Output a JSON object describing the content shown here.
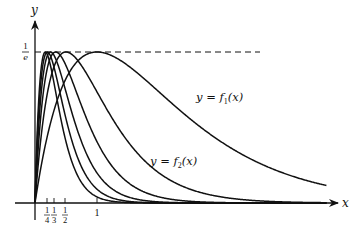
{
  "chart_data": {
    "type": "line",
    "title": "",
    "xlabel": "x",
    "ylabel": "y",
    "formula": "f_n(x) = n*x*exp(-n*x)",
    "x_ticks": [
      {
        "label_num": "1",
        "label_den": "4",
        "value": 0.25
      },
      {
        "label_num": "1",
        "label_den": "3",
        "value": 0.3333
      },
      {
        "label_num": "1",
        "label_den": "2",
        "value": 0.5
      },
      {
        "label_num": "1",
        "label_den": "",
        "value": 1
      }
    ],
    "y_ticks": [
      {
        "label_num": "1",
        "label_den": "e",
        "value": 0.3679
      }
    ],
    "reference_line": {
      "y": 0.3679,
      "style": "dashed",
      "x_end": 3.6
    },
    "xlim": [
      -0.3,
      4.9
    ],
    "ylim": [
      -0.04,
      0.48
    ],
    "grid": false,
    "legend": "none (inline labels)",
    "annotations": [
      {
        "text_lhs": "y = ",
        "fn": "f",
        "sub": "1",
        "arg": "(x)",
        "x": 1.75,
        "y": 0.27
      },
      {
        "text_lhs": "y = ",
        "fn": "f",
        "sub": "2",
        "arg": "(x)",
        "x": 1.86,
        "y": 0.1
      }
    ],
    "x": [
      0,
      0.25,
      0.5,
      1,
      2,
      3,
      4,
      4.7
    ],
    "series": [
      {
        "name": "f1",
        "n": 1,
        "values": [
          0,
          0.1947,
          0.3033,
          0.3679,
          0.2707,
          0.1494,
          0.0733,
          0.0427
        ]
      },
      {
        "name": "f2",
        "n": 2,
        "values": [
          0,
          0.3033,
          0.3679,
          0.2707,
          0.0733,
          0.0149,
          0.0027,
          0.0008
        ]
      },
      {
        "name": "f3",
        "n": 3,
        "values": [
          0,
          0.3543,
          0.3347,
          0.1494,
          0.0149,
          0.0011,
          0.0001,
          0.0
        ]
      },
      {
        "name": "f4",
        "n": 4,
        "values": [
          0,
          0.3679,
          0.2707,
          0.0733,
          0.0027,
          0.0,
          0.0,
          0.0
        ]
      },
      {
        "name": "f5",
        "n": 5,
        "values": [
          0,
          0.3581,
          0.2052,
          0.0337,
          0.0005,
          0.0,
          0.0,
          0.0
        ]
      },
      {
        "name": "f6",
        "n": 6,
        "values": [
          0,
          0.3347,
          0.1494,
          0.0149,
          0.0,
          0.0,
          0.0,
          0.0
        ]
      }
    ]
  },
  "axes": {
    "x_label": "x",
    "y_label": "y",
    "y_tick_num": "1",
    "y_tick_den": "e"
  },
  "labels": {
    "f1": {
      "lhs": "y = ",
      "fn": "f",
      "sub": "1",
      "arg": "(x)"
    },
    "f2": {
      "lhs": "y = ",
      "fn": "f",
      "sub": "2",
      "arg": "(x)"
    }
  },
  "ticks": [
    {
      "num": "1",
      "den": "4"
    },
    {
      "num": "1",
      "den": "3"
    },
    {
      "num": "1",
      "den": "2"
    },
    {
      "num": "1",
      "den": ""
    }
  ],
  "style": {
    "ink": "#111111",
    "background": "#ffffff"
  }
}
